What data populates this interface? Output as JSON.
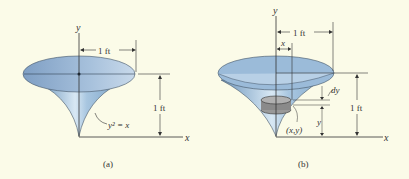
{
  "background": "#fbfbe8",
  "colors": {
    "funnel_fill": "#9fc0dc",
    "funnel_dark": "#6f97bd",
    "top_ellipse": "#8fb0d2",
    "disk": "#888888",
    "line": "#333333"
  },
  "figure_a": {
    "caption": "(a)",
    "axis_y": "y",
    "axis_x": "x",
    "radius_label": "1 ft",
    "height_label": "1 ft",
    "curve_label": "y² = x"
  },
  "figure_b": {
    "caption": "(b)",
    "axis_y": "y",
    "axis_x": "x",
    "radius_label": "1 ft",
    "height_label": "1 ft",
    "x_label": "x",
    "dy_label": "dy",
    "point_label": "(x,y)",
    "y_label": "y"
  }
}
